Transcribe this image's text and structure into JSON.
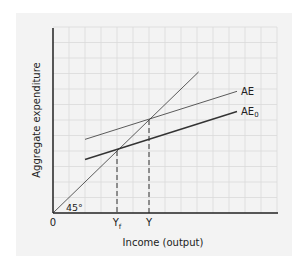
{
  "chart_data": {
    "type": "line",
    "title": "",
    "xlabel": "Income (output)",
    "ylabel": "Aggregate expenditure",
    "origin_label": "0",
    "angle_label": "45°",
    "x_ticks": [
      {
        "label": "Y",
        "sub": "f",
        "x": 4
      },
      {
        "label": "Y",
        "sub": "",
        "x": 6
      }
    ],
    "grid": true,
    "series": [
      {
        "name": "45° line",
        "label": "",
        "points": [
          [
            0,
            0
          ],
          [
            9.1,
            9.1
          ]
        ],
        "width": 0.8
      },
      {
        "name": "AE",
        "label": "AE",
        "label_sub": "",
        "points": [
          [
            2,
            4.75
          ],
          [
            11.5,
            7.85
          ]
        ],
        "width": 0.8
      },
      {
        "name": "AE0",
        "label": "AE",
        "label_sub": "0",
        "points": [
          [
            2,
            3.45
          ],
          [
            11.5,
            6.55
          ]
        ],
        "width": 1.4
      }
    ],
    "equilibria": [
      {
        "name": "Yf",
        "x": 4,
        "y": 4
      },
      {
        "name": "Y",
        "x": 6,
        "y": 6
      }
    ],
    "xlim": [
      0,
      14
    ],
    "ylim": [
      0,
      12
    ]
  },
  "colors": {
    "panel": "#f3f3f3",
    "grid": "#d9d9d9",
    "axis": "#222222",
    "line": "#333333"
  }
}
